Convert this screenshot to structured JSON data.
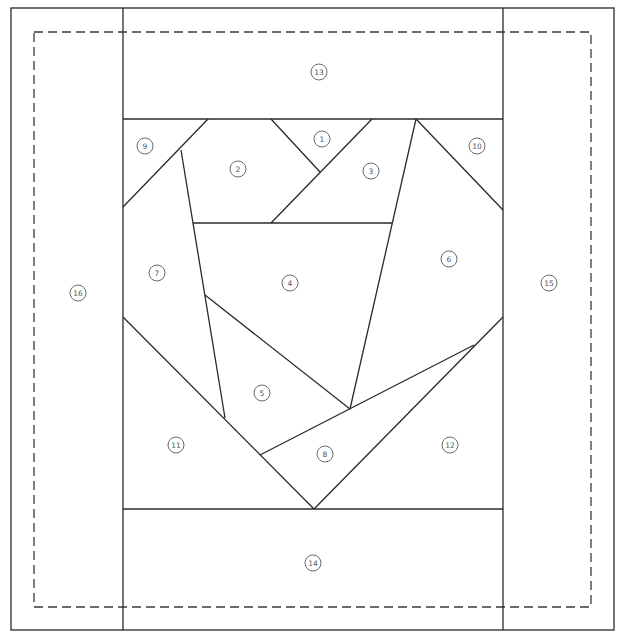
{
  "colors": {
    "line": "#2a2a2a",
    "label": "#555555",
    "background": "#ffffff"
  },
  "outer_border": {
    "x1": 11,
    "y1": 8,
    "x2": 614,
    "y2": 630
  },
  "seam_allowance": {
    "x1": 34,
    "y1": 32,
    "x2": 591,
    "y2": 607,
    "style": "dashed"
  },
  "segments": [
    [
      123,
      8,
      123,
      630
    ],
    [
      503,
      8,
      503,
      630
    ],
    [
      123,
      119,
      503,
      119
    ],
    [
      123,
      509,
      503,
      509
    ],
    [
      208,
      119,
      123,
      207
    ],
    [
      181,
      150,
      225,
      418
    ],
    [
      271,
      119,
      320,
      172
    ],
    [
      372,
      119,
      271,
      223
    ],
    [
      193,
      223,
      392,
      223
    ],
    [
      416,
      119,
      350,
      409
    ],
    [
      416,
      119,
      503,
      210
    ],
    [
      205,
      295,
      350,
      409
    ],
    [
      123,
      317,
      314,
      509
    ],
    [
      503,
      317,
      314,
      509
    ],
    [
      260,
      455,
      474,
      345
    ]
  ],
  "pieces": [
    {
      "label": "1",
      "x": 322,
      "y": 139
    },
    {
      "label": "2",
      "x": 238,
      "y": 169
    },
    {
      "label": "3",
      "x": 371,
      "y": 171
    },
    {
      "label": "4",
      "x": 290,
      "y": 283
    },
    {
      "label": "5",
      "x": 262,
      "y": 393
    },
    {
      "label": "6",
      "x": 449,
      "y": 259
    },
    {
      "label": "7",
      "x": 157,
      "y": 273
    },
    {
      "label": "8",
      "x": 325,
      "y": 454
    },
    {
      "label": "9",
      "x": 145,
      "y": 146
    },
    {
      "label": "10",
      "x": 477,
      "y": 146
    },
    {
      "label": "11",
      "x": 176,
      "y": 445
    },
    {
      "label": "12",
      "x": 450,
      "y": 445
    },
    {
      "label": "13",
      "x": 319,
      "y": 72
    },
    {
      "label": "14",
      "x": 313,
      "y": 563
    },
    {
      "label": "15",
      "x": 549,
      "y": 283
    },
    {
      "label": "16",
      "x": 78,
      "y": 293
    }
  ]
}
